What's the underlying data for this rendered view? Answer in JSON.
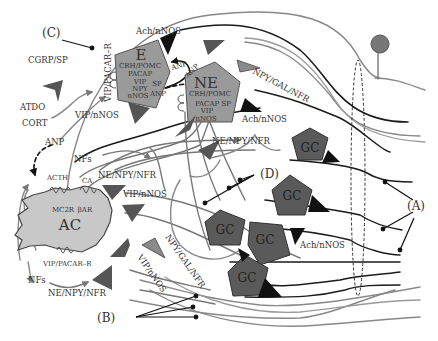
{
  "diagram": {
    "panel_labels": {
      "A": "(A)",
      "B": "(B)",
      "C": "(C)",
      "D": "(D)"
    },
    "cells": {
      "E": {
        "title": "E",
        "lines": [
          "CRH/POMC",
          "PACAP",
          "VIP",
          "NPY",
          "nNOS"
        ],
        "side_labels": [
          "SP",
          "ANP"
        ]
      },
      "NE": {
        "title": "NE",
        "lines": [
          "CRH/POMC",
          "PACAP SP",
          "VIP",
          "nNOS"
        ]
      },
      "AC": {
        "title": "AC",
        "receptors": [
          "MC2R",
          "βAR"
        ],
        "inputs": [
          "ACTH",
          "CA"
        ],
        "receptor_bottom": "VIP/PACAR–R"
      },
      "GC": {
        "label": "GC",
        "count": 5
      }
    },
    "labels": {
      "cgrp_sp": "CGRP/SP",
      "atdo": "ATDO",
      "cort": "CORT",
      "anp_left": "ANP",
      "nfs_top": "NFs",
      "nfs_bottom": "NFs",
      "vip_pacar_r_vertical": "VIP/PACAR–R",
      "vip_nnos_top": "VIP/nNOS",
      "vip_nnos_mid": "VIP/nNOS",
      "vip_nnos_diag": "VIP/nNOS",
      "ach_nnos_top": "Ach/nNOS",
      "ach_nnos_right": "Ach/nNOS",
      "ach_nnos_bottom": "Ach/nNOS",
      "npy_gal_nfr_top": "NPY/GAL/NFR",
      "npy_gal_nfr_bottom": "NPY/GAL/NFR",
      "ne_npy_nfr_right": "NE/NPY/NFR",
      "ne_npy_nfr_mid": "NE/NPY/NFR",
      "ne_npy_nfr_bottom": "NE/NPY/NFR",
      "anp_arrow_1": "ANP",
      "anp_arrow_2": "ANP"
    },
    "colors": {
      "cell_fill": "#9a9a9a",
      "gc_fill": "#5a5a5a",
      "ac_fill": "#c8c8c8",
      "terminal_dark": "#111111",
      "terminal_mid": "#555555",
      "terminal_light": "#8a8a8a",
      "fiber_dark": "#1a1a1a",
      "fiber_gray": "#777777",
      "fiber_light": "#9a9a9a",
      "neuron_body": "#777777"
    }
  }
}
